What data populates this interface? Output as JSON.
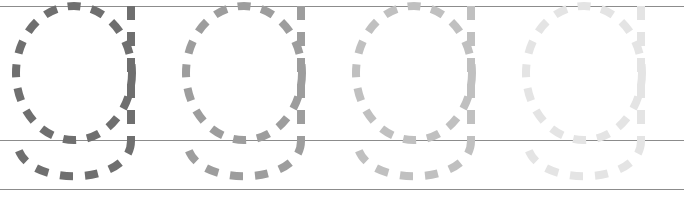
{
  "worksheet": {
    "type": "handwriting-tracing-worksheet",
    "width": 684,
    "height": 201,
    "background_color": "#ffffff",
    "letter": "g",
    "letter_case": "lowercase",
    "repetitions": 4,
    "style": "dashed-trace-guide",
    "fade_direction": "left-to-right"
  },
  "rule_lines": {
    "color": "#8c8c8c",
    "stroke_width": 1.2,
    "items": [
      {
        "name": "top-line",
        "label": "top line",
        "y": 6.5,
        "x1": 0,
        "x2": 684
      },
      {
        "name": "midline",
        "label": "midline",
        "y": 140.5,
        "x1": 0,
        "x2": 684
      },
      {
        "name": "baseline",
        "label": "baseline",
        "y": 189.5,
        "x1": 0,
        "x2": 684
      }
    ]
  },
  "letter_glyphs": [
    {
      "name": "letter-g-1",
      "index": 1,
      "label": "g",
      "color": "#6f6f6f",
      "offset_x": 0,
      "opacity": 1
    },
    {
      "name": "letter-g-2",
      "index": 2,
      "label": "g",
      "color": "#9d9d9d",
      "offset_x": 170,
      "opacity": 1
    },
    {
      "name": "letter-g-3",
      "index": 3,
      "label": "g",
      "color": "#c0c0c0",
      "offset_x": 340,
      "opacity": 1
    },
    {
      "name": "letter-g-4",
      "index": 4,
      "label": "g",
      "color": "#e4e4e4",
      "offset_x": 510,
      "opacity": 1
    }
  ],
  "glyph_geometry": {
    "bowl": {
      "name": "letter-bowl-oval",
      "center_x": 74,
      "center_y": 73,
      "radius_x": 58,
      "radius_y": 67,
      "stroke_width": 8,
      "dash_pattern": "13 11"
    },
    "descender_stem": {
      "name": "letter-descender-stem",
      "x": 131,
      "y_top": 6,
      "y_bottom": 141,
      "stroke_width": 8,
      "dash_pattern": "14 12"
    },
    "descender_hook": {
      "name": "letter-descender-hook",
      "left_x": 17,
      "right_x": 131,
      "top_y": 141,
      "bottom_y": 188,
      "stroke_width": 8,
      "dash_pattern": "13 12"
    }
  }
}
